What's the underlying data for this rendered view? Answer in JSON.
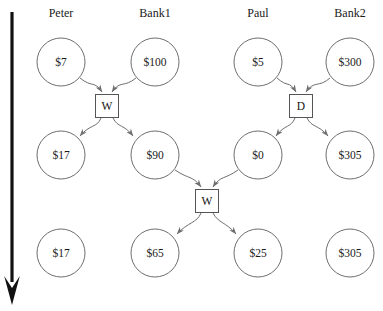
{
  "diagram": {
    "type": "message-sequence-chart",
    "background_color": "#ffffff",
    "stroke_color": "#6e6e6e",
    "text_color": "#1a1a1a",
    "timeline": {
      "name": "time-arrow",
      "orientation": "vertical-downward",
      "color": "#111111",
      "x": 12,
      "y_start": 12,
      "y_end": 305
    },
    "columns": [
      {
        "id": "peter",
        "label": "Peter",
        "x": 61
      },
      {
        "id": "bank1",
        "label": "Bank1",
        "x": 155
      },
      {
        "id": "paul",
        "label": "Paul",
        "x": 258
      },
      {
        "id": "bank2",
        "label": "Bank2",
        "x": 350
      }
    ],
    "rows": [
      {
        "id": "row-1",
        "y": 62
      },
      {
        "id": "row-2",
        "y": 155
      },
      {
        "id": "row-3",
        "y": 253
      }
    ],
    "states": [
      {
        "id": "s-peter-1",
        "column": "peter",
        "row": "row-1",
        "value": "$7",
        "cx": 61,
        "cy": 62,
        "r": 24
      },
      {
        "id": "s-bank1-1",
        "column": "bank1",
        "row": "row-1",
        "value": "$100",
        "cx": 155,
        "cy": 62,
        "r": 24
      },
      {
        "id": "s-paul-1",
        "column": "paul",
        "row": "row-1",
        "value": "$5",
        "cx": 258,
        "cy": 62,
        "r": 24
      },
      {
        "id": "s-bank2-1",
        "column": "bank2",
        "row": "row-1",
        "value": "$300",
        "cx": 350,
        "cy": 62,
        "r": 24
      },
      {
        "id": "s-peter-2",
        "column": "peter",
        "row": "row-2",
        "value": "$17",
        "cx": 61,
        "cy": 155,
        "r": 24
      },
      {
        "id": "s-bank1-2",
        "column": "bank1",
        "row": "row-2",
        "value": "$90",
        "cx": 155,
        "cy": 155,
        "r": 24
      },
      {
        "id": "s-paul-2",
        "column": "paul",
        "row": "row-2",
        "value": "$0",
        "cx": 258,
        "cy": 155,
        "r": 24
      },
      {
        "id": "s-bank2-2",
        "column": "bank2",
        "row": "row-2",
        "value": "$305",
        "cx": 350,
        "cy": 155,
        "r": 24
      },
      {
        "id": "s-peter-3",
        "column": "peter",
        "row": "row-3",
        "value": "$17",
        "cx": 61,
        "cy": 253,
        "r": 24
      },
      {
        "id": "s-bank1-3",
        "column": "bank1",
        "row": "row-3",
        "value": "$65",
        "cx": 155,
        "cy": 253,
        "r": 24
      },
      {
        "id": "s-paul-3",
        "column": "paul",
        "row": "row-3",
        "value": "$25",
        "cx": 258,
        "cy": 253,
        "r": 24
      },
      {
        "id": "s-bank2-3",
        "column": "bank2",
        "row": "row-3",
        "value": "$305",
        "cx": 350,
        "cy": 253,
        "r": 24
      }
    ],
    "transitions": [
      {
        "id": "t-w1",
        "label": "W",
        "cx": 107,
        "cy": 106,
        "w": 23,
        "h": 23,
        "inputs": [
          "s-peter-1",
          "s-bank1-1"
        ],
        "outputs": [
          "s-peter-2",
          "s-bank1-2"
        ]
      },
      {
        "id": "t-d1",
        "label": "D",
        "cx": 301,
        "cy": 106,
        "w": 23,
        "h": 23,
        "inputs": [
          "s-paul-1",
          "s-bank2-1"
        ],
        "outputs": [
          "s-paul-2",
          "s-bank2-2"
        ]
      },
      {
        "id": "t-w2",
        "label": "W",
        "cx": 207,
        "cy": 201,
        "w": 23,
        "h": 23,
        "inputs": [
          "s-bank1-2",
          "s-paul-2"
        ],
        "outputs": [
          "s-bank1-3",
          "s-paul-3"
        ]
      }
    ]
  }
}
